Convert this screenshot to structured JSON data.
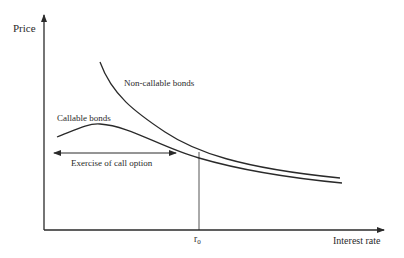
{
  "diagram": {
    "y_axis_label": "Price",
    "x_axis_label": "Interest rate",
    "curves": [
      {
        "name": "Non-callable bonds",
        "label": "Non-callable bonds"
      },
      {
        "name": "Callable bonds",
        "label": "Callable bonds"
      }
    ],
    "annotation": "Exercise of call option",
    "threshold_label": "r",
    "threshold_subscript": "0",
    "line_color": "#2a2a2a"
  }
}
